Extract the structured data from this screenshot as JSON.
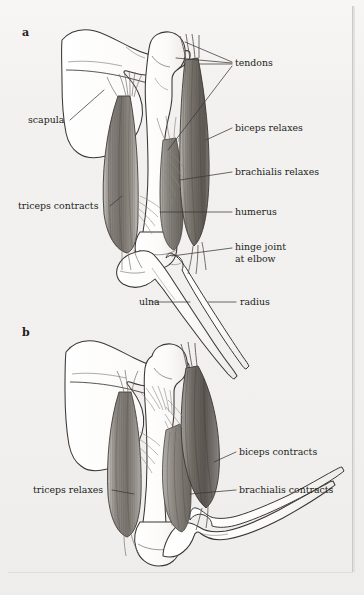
{
  "figure": {
    "title_visible": false,
    "background_color": "#f2f1ef",
    "ink_color": "#211d1a",
    "panels": [
      {
        "id": "a",
        "letter": "a",
        "description_visible": false,
        "state": "arm extended"
      },
      {
        "id": "b",
        "letter": "b",
        "description_visible": false,
        "state": "arm flexed"
      }
    ]
  },
  "panel_a": {
    "letter": "a",
    "labels": {
      "tendons": "tendons",
      "biceps_relaxes": "biceps relaxes",
      "brachialis_relaxes": "brachialis relaxes",
      "humerus": "humerus",
      "hinge_joint_line1": "hinge joint",
      "hinge_joint_line2": "at elbow",
      "radius": "radius",
      "ulna": "ulna",
      "scapula": "scapula",
      "triceps_contracts": "triceps contracts"
    }
  },
  "panel_b": {
    "letter": "b",
    "labels": {
      "biceps_contracts": "biceps contracts",
      "brachialis_contracts": "brachialis contracts",
      "triceps_relaxes": "triceps relaxes"
    }
  },
  "colors": {
    "paper": "#f2f1ef",
    "ink": "#211d1a",
    "leader_line": "#3b3734",
    "bone_fill": "#fbfbf9",
    "bone_outline": "#3a3633",
    "muscle_dark": "#6e6964",
    "muscle_mid": "#8d8883",
    "muscle_light": "#b9b5b0",
    "tendon": "#9c9791",
    "rule": "#c9c9c9"
  }
}
